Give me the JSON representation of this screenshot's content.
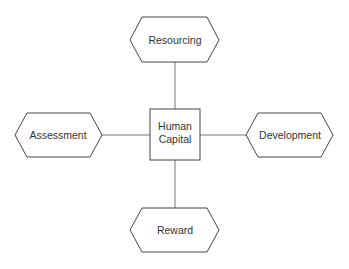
{
  "diagram": {
    "type": "hub-and-spoke",
    "center": {
      "label_line1": "Human",
      "label_line2": "Capital",
      "shape": "square"
    },
    "nodes": [
      {
        "id": "top",
        "label": "Resourcing",
        "shape": "hexagon"
      },
      {
        "id": "left",
        "label": "Assessment",
        "shape": "hexagon"
      },
      {
        "id": "right",
        "label": "Development",
        "shape": "hexagon"
      },
      {
        "id": "bottom",
        "label": "Reward",
        "shape": "hexagon"
      }
    ],
    "edges": [
      {
        "from": "center",
        "to": "top"
      },
      {
        "from": "center",
        "to": "left"
      },
      {
        "from": "center",
        "to": "right"
      },
      {
        "from": "center",
        "to": "bottom"
      }
    ],
    "colors": {
      "stroke": "#444444",
      "connector": "#777777",
      "text": "#333333",
      "background": "#ffffff"
    }
  }
}
